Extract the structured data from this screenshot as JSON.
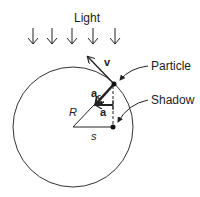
{
  "diagram": {
    "light_label": "Light",
    "velocity_label": "v",
    "particle_label": "Particle",
    "centripetal_label": "a",
    "centripetal_subscript": "c",
    "accel_label": "a",
    "shadow_label": "Shadow",
    "radius_label": "R",
    "displacement_label": "s",
    "light_arrow_count": 5,
    "colors": {
      "ink": "#222222",
      "background": "#ffffff"
    }
  }
}
